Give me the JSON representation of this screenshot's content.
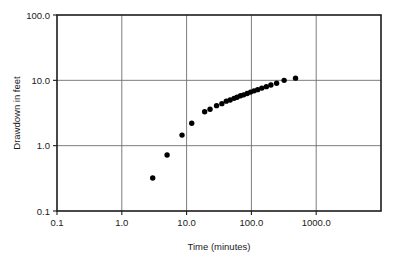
{
  "chart_data": {
    "type": "scatter",
    "title": "",
    "xlabel": "Time (minutes)",
    "ylabel": "Drawdown in feet",
    "xscale": "log",
    "yscale": "log",
    "xlim": [
      0.1,
      10000.0
    ],
    "ylim": [
      0.1,
      100.0
    ],
    "xticks": [
      0.1,
      1.0,
      10.0,
      100.0,
      1000.0
    ],
    "xticklabels": [
      "0.1",
      "1.0",
      "10.0",
      "100.0",
      "1000.0"
    ],
    "yticks": [
      0.1,
      1.0,
      10.0,
      100.0
    ],
    "yticklabels": [
      "0.1",
      "1.0",
      "10.0",
      "100.0"
    ],
    "grid": true,
    "grid_axes": "both",
    "legend": false,
    "marker": "circle",
    "marker_color": "#000000",
    "series": [
      {
        "name": "Drawdown",
        "x": [
          3.0,
          5.0,
          8.5,
          12.0,
          19.0,
          23.0,
          29.0,
          35.0,
          41.0,
          47.0,
          54.0,
          60.0,
          68.0,
          76.0,
          86.0,
          97.0,
          110.0,
          125.0,
          145.0,
          170.0,
          200.0,
          245.0,
          320.0,
          480.0
        ],
        "y": [
          0.32,
          0.72,
          1.45,
          2.2,
          3.3,
          3.6,
          4.1,
          4.4,
          4.8,
          5.0,
          5.3,
          5.5,
          5.8,
          6.0,
          6.3,
          6.6,
          6.9,
          7.2,
          7.6,
          8.0,
          8.5,
          9.0,
          10.0,
          10.8
        ]
      }
    ]
  },
  "axes": {
    "x_title": "Time (minutes)",
    "y_title": "Drawdown in feet"
  }
}
